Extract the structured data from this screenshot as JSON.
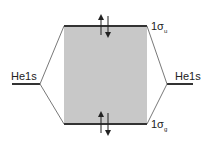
{
  "diagram": {
    "type": "molecular-orbital-energy-diagram",
    "left_atomic_orbital": {
      "label": "He1s"
    },
    "right_atomic_orbital": {
      "label": "He1s"
    },
    "antibonding_orbital": {
      "label": "1σ",
      "subscript": "u",
      "electrons": 2
    },
    "bonding_orbital": {
      "label": "1σ",
      "subscript": "g",
      "electrons": 2
    },
    "colors": {
      "line": "#333333",
      "box_fill": "#c8c8c8",
      "text": "#222222"
    }
  }
}
